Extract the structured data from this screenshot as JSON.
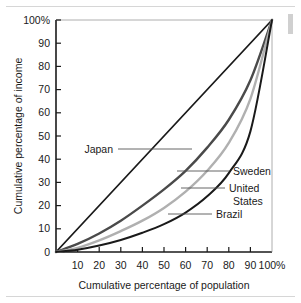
{
  "figure": {
    "background_color": "#ffffff",
    "rule_color": "#d6d6d6",
    "edge_marker_color": "#d0d0d0"
  },
  "chart_data": {
    "type": "line",
    "title": "",
    "subtitle": "",
    "xlabel": "Cumulative percentage of population",
    "ylabel": "Cumulative percentage of income",
    "xlim": [
      0,
      100
    ],
    "ylim": [
      0,
      100
    ],
    "grid": false,
    "legend_position": "inline-annotations",
    "x_tick_labels": [
      "10",
      "20",
      "30",
      "40",
      "50",
      "60",
      "70",
      "80",
      "90",
      "100%"
    ],
    "x_tick_values": [
      10,
      20,
      30,
      40,
      50,
      60,
      70,
      80,
      90,
      100
    ],
    "y_tick_labels": [
      "0",
      "10",
      "20",
      "30",
      "40",
      "50",
      "60",
      "70",
      "80",
      "90",
      "100%"
    ],
    "y_tick_values": [
      0,
      10,
      20,
      30,
      40,
      50,
      60,
      70,
      80,
      90,
      100
    ],
    "x": [
      0,
      10,
      20,
      30,
      40,
      50,
      60,
      70,
      80,
      90,
      100
    ],
    "series": [
      {
        "name": "Japan",
        "color": "#1a1a1a",
        "width": 1.8,
        "values": [
          0,
          10,
          20,
          30,
          40,
          50,
          60,
          70,
          80,
          90,
          100
        ]
      },
      {
        "name": "Sweden",
        "color": "#4a4a4a",
        "width": 2.4,
        "values": [
          0,
          3.5,
          8,
          13.5,
          20,
          27,
          35,
          45,
          57,
          74,
          100
        ]
      },
      {
        "name": "United States",
        "color": "#b0b0b0",
        "width": 2.4,
        "values": [
          0,
          1.8,
          5,
          9,
          13.5,
          19,
          26,
          35,
          47,
          66,
          100
        ]
      },
      {
        "name": "Brazil",
        "color": "#1a1a1a",
        "width": 2.0,
        "values": [
          0,
          1.0,
          2.8,
          5.2,
          8.3,
          12,
          17,
          24,
          34,
          52,
          100
        ]
      }
    ],
    "annotations": [
      {
        "label": "Japan",
        "text_anchor": "end",
        "label_x_px": 113,
        "label_y_px": 153,
        "leader_from_px": [
          118,
          149
        ],
        "leader_to_px": [
          192,
          149
        ]
      },
      {
        "label": "Sweden",
        "text_anchor": "start",
        "label_x_px": 233,
        "label_y_px": 175,
        "leader_from_px": [
          177,
          171
        ],
        "leader_to_px": [
          229,
          171
        ]
      },
      {
        "label": "United",
        "text_anchor": "start",
        "label_x_px": 229,
        "label_y_px": 192,
        "leader_from_px": [
          181,
          188
        ],
        "leader_to_px": [
          225,
          188
        ]
      },
      {
        "label": "States",
        "text_anchor": "start",
        "label_x_px": 233,
        "label_y_px": 205,
        "leader_from_px": null,
        "leader_to_px": null
      },
      {
        "label": "Brazil",
        "text_anchor": "start",
        "label_x_px": 216,
        "label_y_px": 218,
        "leader_from_px": [
          168,
          214
        ],
        "leader_to_px": [
          212,
          214
        ]
      }
    ]
  }
}
